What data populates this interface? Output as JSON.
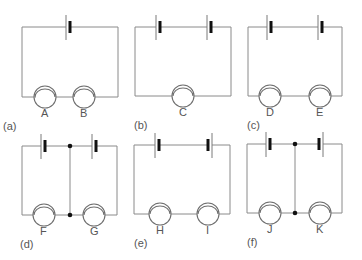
{
  "figure": {
    "colors": {
      "wire": "#8a8a8a",
      "plate_thick": "#111111",
      "label": "#555555",
      "background": "#ffffff"
    },
    "panels": [
      {
        "id": "a",
        "caption": "(a)",
        "description": "one cell, two lamps in series",
        "cells": 1,
        "cell_orientation": [
          "normal"
        ],
        "lamps": [
          "A",
          "B"
        ],
        "junctions": false
      },
      {
        "id": "b",
        "caption": "(b)",
        "description": "two cells in series (same direction), one lamp",
        "cells": 2,
        "cell_orientation": [
          "normal",
          "normal"
        ],
        "lamps": [
          "C"
        ],
        "junctions": false
      },
      {
        "id": "c",
        "caption": "(c)",
        "description": "two cells in series (same direction), two lamps in series",
        "cells": 2,
        "cell_orientation": [
          "normal",
          "normal"
        ],
        "lamps": [
          "D",
          "E"
        ],
        "junctions": false
      },
      {
        "id": "d",
        "caption": "(d)",
        "description": "two cells, two lamps, middle cross-wire joining between cells and between lamps",
        "cells": 2,
        "cell_orientation": [
          "normal",
          "normal"
        ],
        "lamps": [
          "F",
          "G"
        ],
        "junctions": true
      },
      {
        "id": "e",
        "caption": "(e)",
        "description": "two cells opposing each other, two lamps in series",
        "cells": 2,
        "cell_orientation": [
          "normal",
          "reversed"
        ],
        "lamps": [
          "H",
          "I"
        ],
        "junctions": false
      },
      {
        "id": "f",
        "caption": "(f)",
        "description": "two cells opposing each other, two lamps, middle cross-wire with junctions",
        "cells": 2,
        "cell_orientation": [
          "normal",
          "reversed"
        ],
        "lamps": [
          "J",
          "K"
        ],
        "junctions": true
      }
    ]
  }
}
